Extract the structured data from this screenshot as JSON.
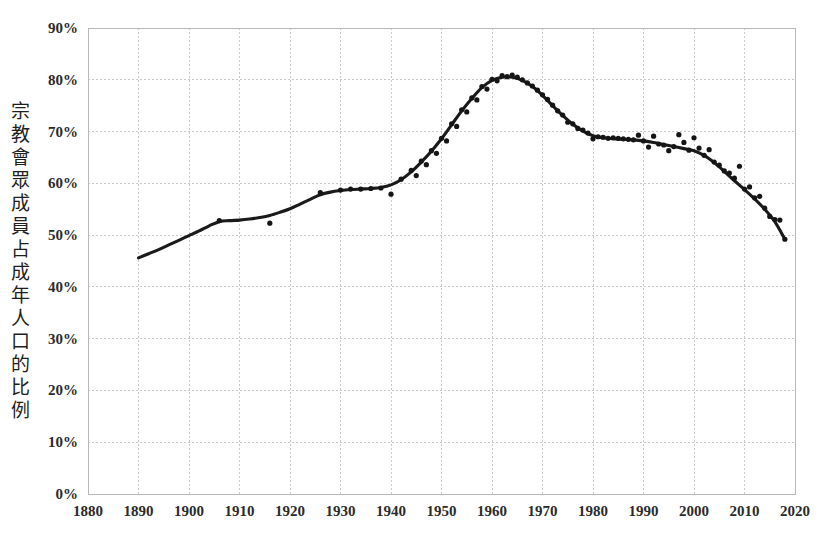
{
  "chart_data": {
    "type": "line",
    "title": "",
    "subtitle": "",
    "xlabel": "",
    "ylabel": "宗教會眾成員占成年人口的比例",
    "xlim": [
      1880,
      2020
    ],
    "ylim": [
      0,
      90
    ],
    "grid": true,
    "legend": "none",
    "x_ticks": [
      1880,
      1890,
      1900,
      1910,
      1920,
      1930,
      1940,
      1950,
      1960,
      1970,
      1980,
      1990,
      2000,
      2010,
      2020
    ],
    "x_tick_labels": [
      "1880",
      "1890",
      "1900",
      "1910",
      "1920",
      "1930",
      "1940",
      "1950",
      "1960",
      "1970",
      "1980",
      "1990",
      "2000",
      "2010",
      "2020"
    ],
    "y_ticks": [
      0,
      10,
      20,
      30,
      40,
      50,
      60,
      70,
      80,
      90
    ],
    "y_tick_labels": [
      "0%",
      "10%",
      "20%",
      "30%",
      "40%",
      "50%",
      "60%",
      "70%",
      "80%",
      "90%"
    ],
    "series": [
      {
        "name": "trend",
        "style": "line",
        "color": "#1a1a1a",
        "x": [
          1890,
          1892,
          1894,
          1896,
          1898,
          1900,
          1902,
          1904,
          1906,
          1908,
          1910,
          1912,
          1914,
          1916,
          1918,
          1920,
          1922,
          1924,
          1926,
          1928,
          1930,
          1932,
          1934,
          1936,
          1938,
          1940,
          1942,
          1944,
          1946,
          1948,
          1950,
          1952,
          1954,
          1956,
          1958,
          1960,
          1962,
          1964,
          1966,
          1968,
          1970,
          1972,
          1974,
          1976,
          1978,
          1980,
          1982,
          1984,
          1986,
          1988,
          1990,
          1992,
          1994,
          1996,
          1998,
          2000,
          2002,
          2004,
          2006,
          2008,
          2010,
          2012,
          2014,
          2016,
          2018
        ],
        "y": [
          45.6,
          46.4,
          47.2,
          48.1,
          49.0,
          49.9,
          50.8,
          51.8,
          52.6,
          52.8,
          52.9,
          53.1,
          53.4,
          53.8,
          54.4,
          55.1,
          56.0,
          56.9,
          57.8,
          58.3,
          58.6,
          58.8,
          58.9,
          59.0,
          59.2,
          59.7,
          60.7,
          62.2,
          64.1,
          66.2,
          68.6,
          71.3,
          74.0,
          76.4,
          78.5,
          79.9,
          80.5,
          80.5,
          79.9,
          78.7,
          77.0,
          75.0,
          73.1,
          71.4,
          70.1,
          69.2,
          68.8,
          68.6,
          68.5,
          68.4,
          68.2,
          67.9,
          67.5,
          67.1,
          66.7,
          66.3,
          65.4,
          64.0,
          62.3,
          60.5,
          58.8,
          57.0,
          55.0,
          52.6,
          49.2
        ]
      },
      {
        "name": "observations",
        "style": "scatter",
        "color": "#151515",
        "points": [
          [
            1906,
            52.8
          ],
          [
            1916,
            52.3
          ],
          [
            1926,
            58.2
          ],
          [
            1930,
            58.7
          ],
          [
            1932,
            58.9
          ],
          [
            1934,
            58.9
          ],
          [
            1936,
            59.0
          ],
          [
            1938,
            59.1
          ],
          [
            1940,
            57.9
          ],
          [
            1942,
            60.8
          ],
          [
            1944,
            62.5
          ],
          [
            1945,
            61.5
          ],
          [
            1946,
            64.3
          ],
          [
            1947,
            63.6
          ],
          [
            1948,
            66.3
          ],
          [
            1949,
            65.8
          ],
          [
            1950,
            68.7
          ],
          [
            1951,
            68.2
          ],
          [
            1952,
            71.5
          ],
          [
            1953,
            71.0
          ],
          [
            1954,
            74.2
          ],
          [
            1955,
            73.8
          ],
          [
            1956,
            76.5
          ],
          [
            1957,
            76.1
          ],
          [
            1958,
            78.7
          ],
          [
            1959,
            78.2
          ],
          [
            1960,
            80.1
          ],
          [
            1961,
            79.8
          ],
          [
            1962,
            80.8
          ],
          [
            1963,
            80.6
          ],
          [
            1964,
            80.9
          ],
          [
            1965,
            80.5
          ],
          [
            1966,
            80.0
          ],
          [
            1967,
            79.4
          ],
          [
            1968,
            78.8
          ],
          [
            1969,
            78.0
          ],
          [
            1970,
            77.1
          ],
          [
            1971,
            76.2
          ],
          [
            1972,
            75.1
          ],
          [
            1973,
            74.0
          ],
          [
            1974,
            73.2
          ],
          [
            1975,
            71.8
          ],
          [
            1976,
            71.5
          ],
          [
            1977,
            70.6
          ],
          [
            1978,
            70.3
          ],
          [
            1979,
            69.7
          ],
          [
            1980,
            68.6
          ],
          [
            1981,
            69.0
          ],
          [
            1982,
            68.9
          ],
          [
            1983,
            68.7
          ],
          [
            1984,
            68.8
          ],
          [
            1985,
            68.7
          ],
          [
            1986,
            68.6
          ],
          [
            1987,
            68.5
          ],
          [
            1988,
            68.4
          ],
          [
            1989,
            69.3
          ],
          [
            1990,
            68.2
          ],
          [
            1991,
            67.0
          ],
          [
            1992,
            69.1
          ],
          [
            1993,
            67.6
          ],
          [
            1994,
            67.4
          ],
          [
            1995,
            66.3
          ],
          [
            1996,
            67.1
          ],
          [
            1997,
            69.4
          ],
          [
            1998,
            67.9
          ],
          [
            1999,
            66.4
          ],
          [
            2000,
            68.8
          ],
          [
            2001,
            66.8
          ],
          [
            2002,
            65.4
          ],
          [
            2003,
            66.5
          ],
          [
            2004,
            64.1
          ],
          [
            2005,
            63.5
          ],
          [
            2006,
            62.4
          ],
          [
            2007,
            62.0
          ],
          [
            2008,
            61.0
          ],
          [
            2009,
            63.3
          ],
          [
            2010,
            58.9
          ],
          [
            2011,
            59.3
          ],
          [
            2012,
            57.2
          ],
          [
            2013,
            57.5
          ],
          [
            2014,
            55.2
          ],
          [
            2015,
            53.6
          ],
          [
            2016,
            53.0
          ],
          [
            2017,
            52.9
          ],
          [
            2018,
            49.2
          ]
        ]
      }
    ]
  },
  "axis": {
    "y_title_chars": [
      "宗",
      "教",
      "會",
      "眾",
      "成",
      "員",
      "占",
      "成",
      "年",
      "人",
      "口",
      "的",
      "比",
      "例"
    ]
  },
  "colors": {
    "line": "#1a1a1a",
    "dot": "#151515",
    "grid": "#c9c9c9",
    "text": "#2b2b2b",
    "background": "#ffffff"
  }
}
